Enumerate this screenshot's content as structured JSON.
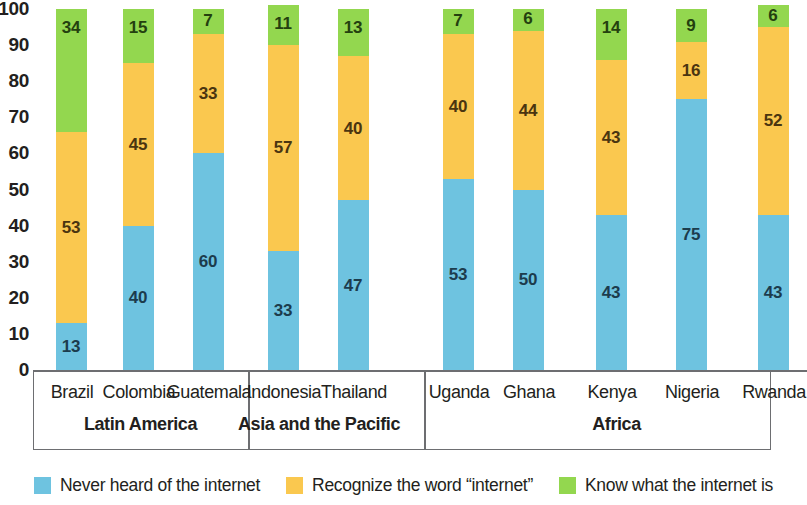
{
  "chart_data": {
    "type": "bar",
    "subtype": "stacked-bar",
    "title": "",
    "xlabel": "",
    "ylabel": "",
    "ylim": [
      0,
      100
    ],
    "ytick_labels": [
      "100",
      "90",
      "80",
      "70",
      "60",
      "50",
      "40",
      "30",
      "20",
      "10",
      "0"
    ],
    "ytick_values": [
      100,
      90,
      80,
      70,
      60,
      50,
      40,
      30,
      20,
      10,
      0
    ],
    "grid": false,
    "legend_position": "bottom",
    "categories": [
      "Brazil",
      "Colombia",
      "Guatemala",
      "Indonesia",
      "Thailand",
      "Uganda",
      "Ghana",
      "Kenya",
      "Nigeria",
      "Rwanda"
    ],
    "groups": [
      {
        "label": "Latin America",
        "categories": [
          "Brazil",
          "Colombia",
          "Guatemala"
        ]
      },
      {
        "label": "Asia and the Pacific",
        "categories": [
          "Indonesia",
          "Thailand"
        ]
      },
      {
        "label": "Africa",
        "categories": [
          "Uganda",
          "Ghana",
          "Kenya",
          "Nigeria",
          "Rwanda"
        ]
      }
    ],
    "series": [
      {
        "name": "Never heard of the internet",
        "color": "#6EC3E0",
        "values": [
          13,
          40,
          60,
          33,
          47,
          53,
          50,
          43,
          75,
          43
        ]
      },
      {
        "name": "Recognize the word “internet”",
        "color": "#FAC84F",
        "values": [
          53,
          45,
          33,
          57,
          40,
          40,
          44,
          43,
          16,
          52
        ]
      },
      {
        "name": "Know what the internet is",
        "color": "#93D74F",
        "values": [
          34,
          15,
          7,
          11,
          13,
          7,
          6,
          14,
          9,
          6
        ]
      }
    ]
  },
  "legend": {
    "items": [
      {
        "label": "Never heard of the internet",
        "color": "#6EC3E0"
      },
      {
        "label": "Recognize the word “internet”",
        "color": "#FAC84F"
      },
      {
        "label": "Know what the internet is",
        "color": "#93D74F"
      }
    ]
  }
}
